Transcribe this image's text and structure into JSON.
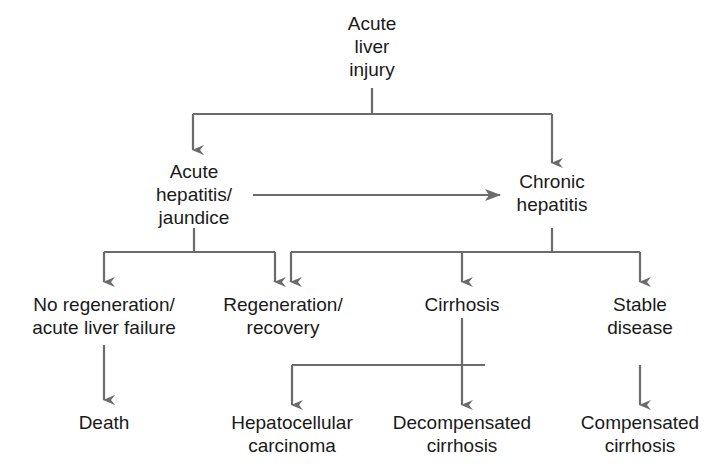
{
  "diagram": {
    "line_color": "#6b6b6b",
    "text_color": "#1a1a1a",
    "nodes": {
      "acute_liver_injury": {
        "lines": [
          "Acute",
          "liver",
          "injury"
        ]
      },
      "acute_hepatitis": {
        "lines": [
          "Acute",
          "hepatitis/",
          "jaundice"
        ]
      },
      "chronic_hepatitis": {
        "lines": [
          "Chronic",
          "hepatitis"
        ]
      },
      "no_regeneration": {
        "lines": [
          "No regeneration/",
          "acute liver failure"
        ]
      },
      "regeneration": {
        "lines": [
          "Regeneration/",
          "recovery"
        ]
      },
      "cirrhosis": {
        "lines": [
          "Cirrhosis"
        ]
      },
      "stable_disease": {
        "lines": [
          "Stable",
          "disease"
        ]
      },
      "death": {
        "lines": [
          "Death"
        ]
      },
      "hcc": {
        "lines": [
          "Hepatocellular",
          "carcinoma"
        ]
      },
      "decompensated": {
        "lines": [
          "Decompensated",
          "cirrhosis"
        ]
      },
      "compensated": {
        "lines": [
          "Compensated",
          "cirrhosis"
        ]
      }
    },
    "edges": [
      {
        "from": "Acute liver injury",
        "to": "Acute hepatitis/jaundice"
      },
      {
        "from": "Acute liver injury",
        "to": "Chronic hepatitis"
      },
      {
        "from": "Acute hepatitis/jaundice",
        "to": "Chronic hepatitis"
      },
      {
        "from": "Acute hepatitis/jaundice",
        "to": "No regeneration/acute liver failure"
      },
      {
        "from": "Acute hepatitis/jaundice",
        "to": "Regeneration/recovery"
      },
      {
        "from": "Chronic hepatitis",
        "to": "Regeneration/recovery"
      },
      {
        "from": "Chronic hepatitis",
        "to": "Cirrhosis"
      },
      {
        "from": "Chronic hepatitis",
        "to": "Stable disease"
      },
      {
        "from": "No regeneration/acute liver failure",
        "to": "Death"
      },
      {
        "from": "Cirrhosis",
        "to": "Hepatocellular carcinoma"
      },
      {
        "from": "Cirrhosis",
        "to": "Decompensated cirrhosis"
      },
      {
        "from": "Stable disease",
        "to": "Compensated cirrhosis"
      }
    ]
  }
}
